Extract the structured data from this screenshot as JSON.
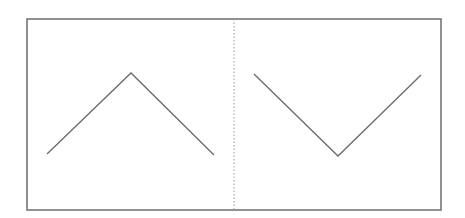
{
  "diagram": {
    "colors": {
      "background": "#ffffff",
      "frame_stroke": "#6e6e6e",
      "divider_stroke": "#9a9a9a",
      "line_stroke": "#6a6a6a"
    },
    "frame": {
      "x": 27,
      "y": 19,
      "width": 414,
      "height": 191
    },
    "divider": {
      "x": 234,
      "y1": 19,
      "y2": 210,
      "style": "dotted"
    },
    "panels": [
      {
        "name": "left",
        "shape": "peak",
        "points": [
          [
            47,
            154
          ],
          [
            131,
            73
          ],
          [
            214,
            155
          ]
        ]
      },
      {
        "name": "right",
        "shape": "valley",
        "points": [
          [
            254,
            74
          ],
          [
            338,
            156
          ],
          [
            421,
            75
          ]
        ]
      }
    ]
  }
}
